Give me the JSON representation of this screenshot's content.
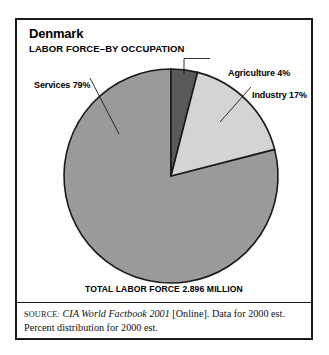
{
  "header": {
    "country": "Denmark",
    "subtitle": "LABOR FORCE–BY OCCUPATION"
  },
  "labels": {
    "agriculture": "Agriculture 4%",
    "industry": "Industry 17%",
    "services": "Services 79%"
  },
  "footer": {
    "total": "TOTAL LABOR FORCE 2.896 MILLION",
    "source_word": "SOURCE:",
    "source_publication": "CIA World Factbook 2001",
    "source_rest": " [Online]. Data for 2000 est. Percent distribution for 2000 est."
  },
  "colors": {
    "agriculture": "#595959",
    "industry": "#d4d4d4",
    "services": "#9a9a9a",
    "outline": "#1a1a1a",
    "frame": "#1a1a1a",
    "background": "#ffffff"
  },
  "chart_data": {
    "type": "pie",
    "subtitle": "TOTAL LABOR FORCE 2.896 MILLION",
    "categories": [
      "Agriculture",
      "Industry",
      "Services"
    ],
    "values": [
      4,
      17,
      79
    ],
    "unit": "percent",
    "total_labor_force_millions": 2.896,
    "start_angle_deg": 0,
    "direction": "clockwise",
    "legend": "callout-labels",
    "slice_colors": [
      "#595959",
      "#d4d4d4",
      "#9a9a9a"
    ],
    "data_labels": [
      "Agriculture 4%",
      "Industry 17%",
      "Services 79%"
    ],
    "source": "CIA World Factbook 2001 [Online]. Data for 2000 est. Percent distribution for 2000 est."
  }
}
